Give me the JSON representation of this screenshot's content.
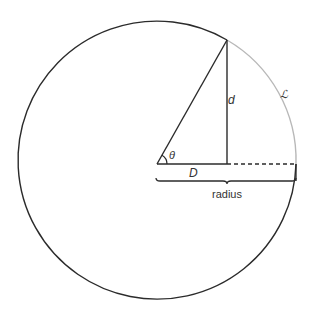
{
  "diagram": {
    "labels": {
      "angle": "θ",
      "horizontal_leg": "D",
      "vertical_leg": "d",
      "arc": "ℒ",
      "radius": "radius"
    },
    "colors": {
      "line": "#2b2b2b",
      "arc_highlight": "#b8b8b8",
      "text": "#333333"
    }
  }
}
